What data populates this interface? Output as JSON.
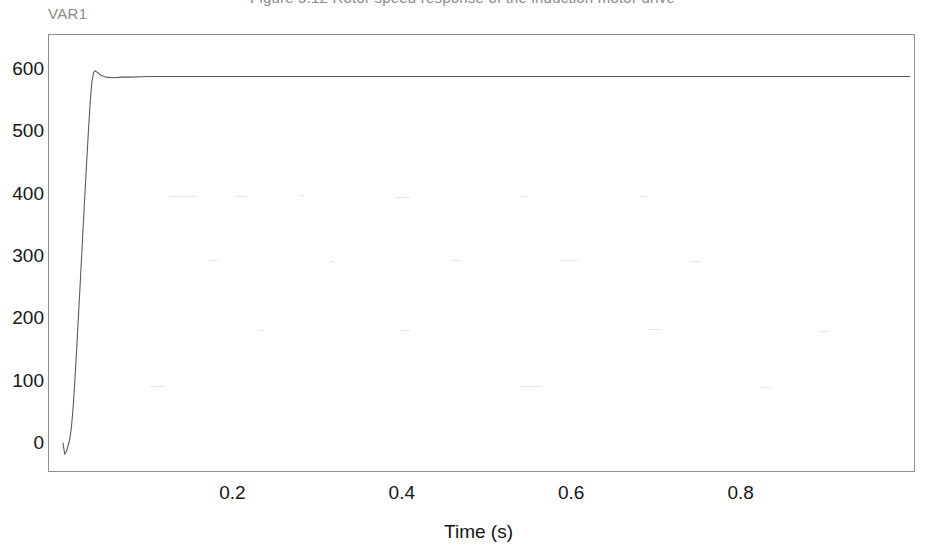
{
  "figure": {
    "cut_caption_fragment": "Figure 5.12  Rotor speed response of the induction motor drive",
    "series_label": "VAR1"
  },
  "chart_data": {
    "type": "line",
    "title": "",
    "subtitle": "",
    "xlabel": "Time (s)",
    "ylabel": "",
    "xlim": [
      0.0,
      1.0
    ],
    "ylim": [
      -30,
      650
    ],
    "grid": false,
    "legend_position": "top-left",
    "legend_entries": [
      "VAR1"
    ],
    "xticks": [
      0.2,
      0.4,
      0.6,
      0.8
    ],
    "xtick_labels": [
      "0.2",
      "0.4",
      "0.6",
      "0.8"
    ],
    "yticks": [
      0,
      100,
      200,
      300,
      400,
      500,
      600
    ],
    "ytick_labels": [
      "0",
      "100",
      "200",
      "300",
      "400",
      "500",
      "600"
    ],
    "line_color": "#5a5a5a",
    "line_width": 1.1,
    "series": [
      {
        "name": "VAR1",
        "x": [
          0.0,
          0.002,
          0.004,
          0.006,
          0.008,
          0.01,
          0.012,
          0.014,
          0.016,
          0.018,
          0.02,
          0.022,
          0.024,
          0.026,
          0.028,
          0.03,
          0.032,
          0.034,
          0.036,
          0.038,
          0.04,
          0.045,
          0.05,
          0.06,
          0.07,
          0.08,
          0.1,
          0.15,
          0.2,
          0.3,
          0.4,
          0.5,
          0.6,
          0.7,
          0.8,
          0.9,
          1.0
        ],
        "y": [
          0,
          -18,
          -14,
          -4,
          6,
          26,
          58,
          100,
          148,
          198,
          248,
          300,
          352,
          402,
          452,
          500,
          545,
          578,
          594,
          597,
          595,
          590,
          587,
          586,
          587,
          587,
          588,
          588,
          588,
          588,
          588,
          588,
          588,
          588,
          588,
          588,
          588
        ]
      }
    ],
    "annotations": {
      "overshoot_peak": 597,
      "steady_state": 588,
      "initial_undershoot": -18,
      "rise_time_s": 0.036
    }
  }
}
